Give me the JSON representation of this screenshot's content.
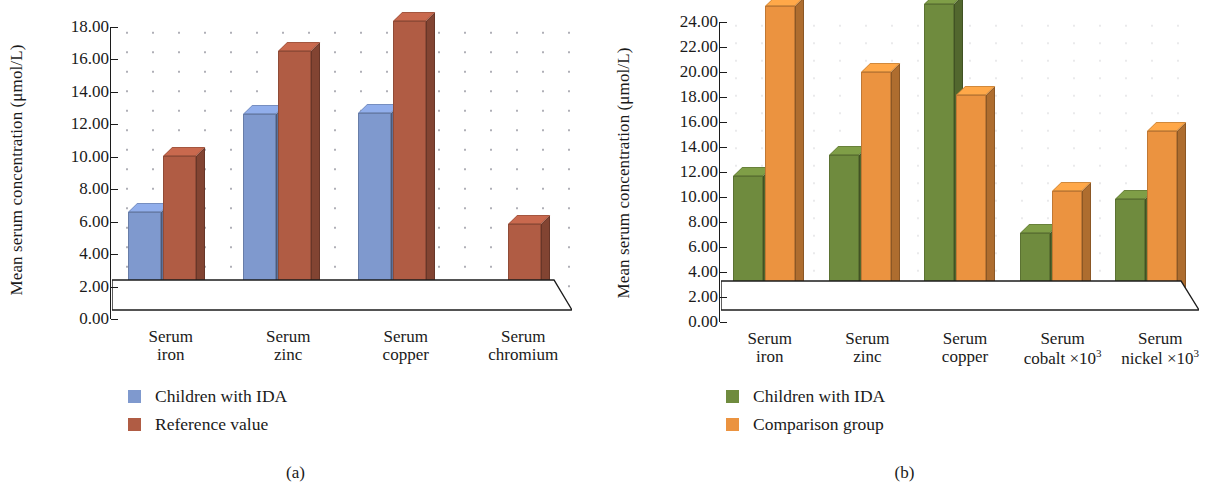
{
  "figure": {
    "panels": [
      {
        "caption": "(a)",
        "ylabel_pre": "Mean serum concentration (",
        "ylabel_mu": "μ",
        "ylabel_post": "mol/L)",
        "chart_data": {
          "type": "bar",
          "title": "",
          "xlabel": "",
          "ylabel": "Mean serum concentration (μmol/L)",
          "ylim": [
            0,
            18
          ],
          "ytick_step": 2,
          "yticks": [
            "0.00",
            "2.00",
            "4.00",
            "6.00",
            "8.00",
            "10.00",
            "12.00",
            "14.00",
            "16.00",
            "18.00"
          ],
          "grid": "dotted",
          "legend_position": "below-left",
          "three_d": true,
          "categories": [
            "Serum\niron",
            "Serum\nzinc",
            "Serum\ncopper",
            "Serum\nchromium"
          ],
          "category_lines": [
            [
              "Serum",
              "iron"
            ],
            [
              "Serum",
              "zinc"
            ],
            [
              "Serum",
              "copper"
            ],
            [
              "Serum",
              "chromium"
            ]
          ],
          "series": [
            {
              "name": "Children with IDA",
              "color": "#7f99ce",
              "values": [
                4.8,
                11.4,
                11.9,
                1.2
              ]
            },
            {
              "name": "Reference value",
              "color": "#b05c44",
              "values": [
                8.3,
                15.3,
                17.6,
                5.4
              ]
            }
          ]
        }
      },
      {
        "caption": "(b)",
        "ylabel_pre": "Mean serum concentration (",
        "ylabel_mu": "μ",
        "ylabel_post": "mol/L)",
        "chart_data": {
          "type": "bar",
          "title": "",
          "xlabel": "",
          "ylabel": "Mean serum concentration (μmol/L)",
          "ylim": [
            0,
            24
          ],
          "ytick_step": 2,
          "yticks": [
            "0.00",
            "2.00",
            "4.00",
            "6.00",
            "8.00",
            "10.00",
            "12.00",
            "14.00",
            "16.00",
            "18.00",
            "20.00",
            "22.00",
            "24.00"
          ],
          "grid": "dotted",
          "legend_position": "below-left",
          "three_d": true,
          "categories": [
            "Serum iron",
            "Serum zinc",
            "Serum copper",
            "Serum cobalt ×10³",
            "Serum nickel ×10³"
          ],
          "category_lines": [
            [
              "Serum",
              "iron"
            ],
            [
              "Serum",
              "zinc"
            ],
            [
              "Serum",
              "copper"
            ],
            [
              "Serum",
              "cobalt ×10",
              "3"
            ],
            [
              "Serum",
              "nickel ×10",
              "3"
            ]
          ],
          "series": [
            {
              "name": "Children with IDA",
              "color": "#6f8b3e",
              "values": [
                9.3,
                11.4,
                24.2,
                5.9,
                9.1
              ]
            },
            {
              "name": "Comparison group",
              "color": "#eb9340",
              "values": [
                23.2,
                18.2,
                16.7,
                9.3,
                14.6
              ]
            }
          ]
        }
      }
    ]
  }
}
